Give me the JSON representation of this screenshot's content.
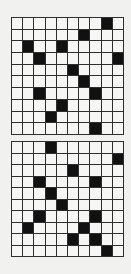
{
  "puzzles": [
    {
      "name": "top",
      "rows": 10,
      "cols": 10,
      "filled": [
        [
          0,
          8
        ],
        [
          1,
          6
        ],
        [
          2,
          1
        ],
        [
          2,
          4
        ],
        [
          3,
          2
        ],
        [
          3,
          9
        ],
        [
          4,
          5
        ],
        [
          5,
          6
        ],
        [
          6,
          2
        ],
        [
          6,
          7
        ],
        [
          7,
          4
        ],
        [
          8,
          3
        ],
        [
          9,
          7
        ]
      ]
    },
    {
      "name": "bottom",
      "rows": 10,
      "cols": 10,
      "filled": [
        [
          0,
          3
        ],
        [
          1,
          9
        ],
        [
          2,
          5
        ],
        [
          3,
          2
        ],
        [
          3,
          7
        ],
        [
          4,
          3
        ],
        [
          5,
          4
        ],
        [
          6,
          2
        ],
        [
          6,
          7
        ],
        [
          7,
          1
        ],
        [
          7,
          6
        ],
        [
          8,
          5
        ],
        [
          8,
          7
        ],
        [
          9,
          8
        ]
      ]
    }
  ],
  "colors": {
    "background": "#f1f1ef",
    "cell": "#f6f6f4",
    "filled": "#111111",
    "line": "#2e2e2e"
  }
}
